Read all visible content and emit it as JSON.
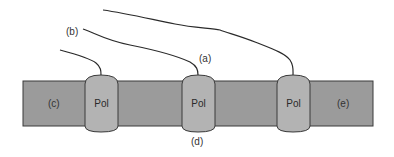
{
  "diagram": {
    "type": "transcription",
    "colors": {
      "dna_fill": "#9b9b9b",
      "dna_stroke": "#3a3a3a",
      "pol_fill": "#b3b3b3",
      "pol_stroke": "#3a3a3a",
      "rna_stroke": "#2a2a2a",
      "background": "#ffffff"
    },
    "polymerases": [
      {
        "label": "Pol"
      },
      {
        "label": "Pol"
      },
      {
        "label": "Pol"
      }
    ],
    "labels": {
      "a": "(a)",
      "b": "(b)",
      "c": "(c)",
      "d": "(d)",
      "e": "(e)"
    }
  }
}
